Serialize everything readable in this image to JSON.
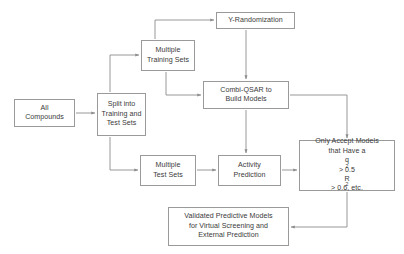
{
  "diagram": {
    "type": "flowchart",
    "background_color": "#ffffff",
    "box_border_color": "#9a9a9a",
    "text_color": "#3a3a3a",
    "edge_color": "#8c8c8c"
  },
  "nodes": {
    "all_compounds": {
      "id": "all-compounds",
      "lines": [
        "All",
        "Compounds"
      ]
    },
    "split": {
      "id": "split-into-training-and-test-sets",
      "lines": [
        "Split into",
        "Training and",
        "Test Sets"
      ]
    },
    "multiple_training_sets": {
      "id": "multiple-training-sets",
      "lines": [
        "Multiple",
        "Training Sets"
      ]
    },
    "y_randomization": {
      "id": "y-randomization",
      "lines": [
        "Y-Randomization"
      ]
    },
    "combi_qsar": {
      "id": "combi-qsar-to-build-models",
      "lines": [
        "Combi-QSAR to",
        "Build Models"
      ]
    },
    "multiple_test_sets": {
      "id": "multiple-test-sets",
      "lines": [
        "Multiple",
        "Test Sets"
      ]
    },
    "activity_prediction": {
      "id": "activity-prediction",
      "lines": [
        "Activity",
        "Prediction"
      ]
    },
    "only_accept": {
      "id": "only-accept-models",
      "line1": "Only Accept Models",
      "line2": "that Have a",
      "line3_base": "q",
      "line3_sup": "2",
      "line3_rest": " > 0.5",
      "line4_base": "R",
      "line4_sup": "2",
      "line4_rest": " > 0.6, etc."
    },
    "validated": {
      "id": "validated-predictive-models",
      "lines": [
        "Validated Predictive Models",
        "for Virtual Screening and",
        "External Prediction"
      ]
    }
  },
  "edges": [
    {
      "id": "all-compounds-to-split",
      "from": "all_compounds",
      "to": "split",
      "style": "arrow"
    },
    {
      "id": "split-to-multiple-training-sets",
      "from": "split",
      "to": "multiple_training_sets",
      "style": "arrow"
    },
    {
      "id": "split-to-multiple-test-sets",
      "from": "split",
      "to": "multiple_test_sets",
      "style": "arrow"
    },
    {
      "id": "multiple-training-sets-to-y-randomization",
      "from": "multiple_training_sets",
      "to": "y_randomization",
      "style": "arrow"
    },
    {
      "id": "multiple-training-sets-to-combi-qsar",
      "from": "multiple_training_sets",
      "to": "combi_qsar",
      "style": "arrow"
    },
    {
      "id": "y-randomization-to-combi-qsar",
      "from": "y_randomization",
      "to": "combi_qsar",
      "style": "arrow"
    },
    {
      "id": "combi-qsar-to-activity-prediction",
      "from": "combi_qsar",
      "to": "activity_prediction",
      "style": "arrow"
    },
    {
      "id": "combi-qsar-to-only-accept",
      "from": "combi_qsar",
      "to": "only_accept",
      "style": "arrow"
    },
    {
      "id": "multiple-test-sets-to-activity-prediction",
      "from": "multiple_test_sets",
      "to": "activity_prediction",
      "style": "arrow"
    },
    {
      "id": "activity-prediction-to-only-accept",
      "from": "activity_prediction",
      "to": "only_accept",
      "style": "arrow"
    },
    {
      "id": "only-accept-to-validated",
      "from": "only_accept",
      "to": "validated",
      "style": "arrow"
    }
  ]
}
